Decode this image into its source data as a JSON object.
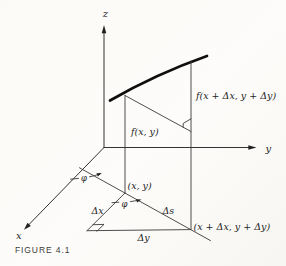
{
  "figure": {
    "caption": "FIGURE 4.1",
    "labels": {
      "z_axis": "z",
      "y_axis": "y",
      "x_axis": "x",
      "f_xy": "f(x, y)",
      "f_xdxdy": "f(x + Δx, y + Δy)",
      "point_xy": "(x, y)",
      "point_xdxdy": "(x + Δx, y + Δy)",
      "delta_x": "Δx",
      "delta_y": "Δy",
      "delta_s": "Δs",
      "phi_upper": "φ",
      "phi_lower": "φ"
    },
    "colors": {
      "paper": "#fbfaf7",
      "ink": "#3a3a3a",
      "curve": "#0f0f0f",
      "text": "#1e1e1e",
      "caption": "#3c3c3c"
    }
  }
}
